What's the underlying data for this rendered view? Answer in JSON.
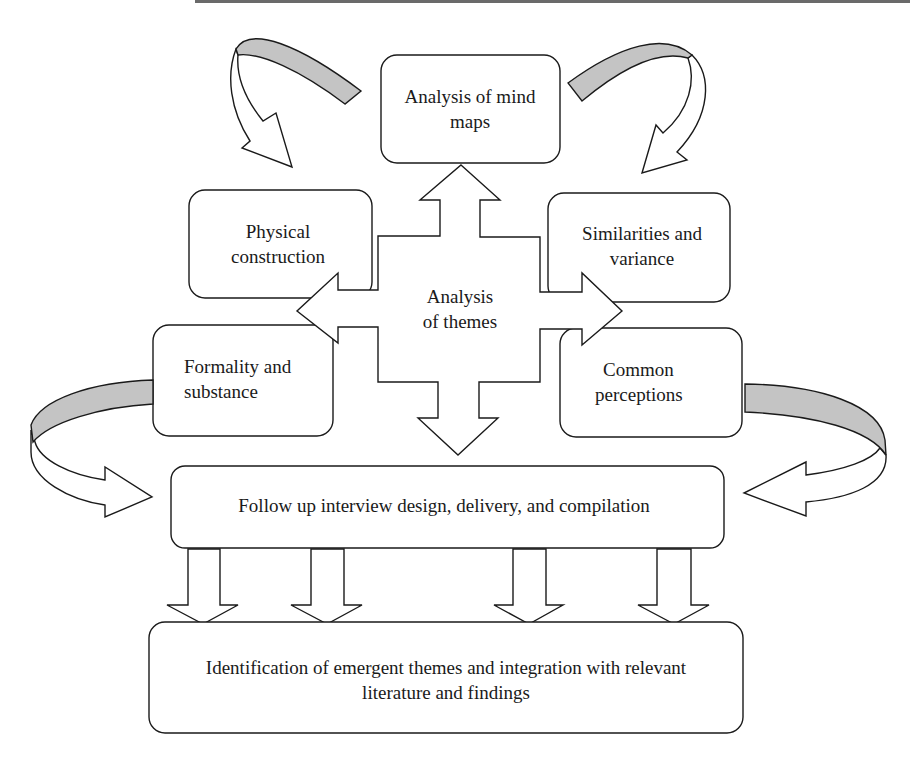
{
  "diagram": {
    "center": {
      "line1": "Analysis",
      "line2": "of themes"
    },
    "nodes": {
      "mind_maps": {
        "line1": "Analysis of mind",
        "line2": "maps"
      },
      "physical": {
        "line1": "Physical",
        "line2": "construction"
      },
      "similarities": {
        "line1": "Similarities and",
        "line2": "variance"
      },
      "formality": {
        "line1": "Formality and",
        "line2": "substance"
      },
      "perceptions": {
        "line1": "Common",
        "line2": "perceptions"
      },
      "follow_up": {
        "line1": "Follow up interview design, delivery, and compilation"
      },
      "emergent": {
        "line1": "Identification of emergent themes and integration with relevant",
        "line2": "literature and findings"
      }
    },
    "colors": {
      "stroke": "#1a1a1a",
      "band_fill": "#c4c4c4",
      "background": "#ffffff"
    }
  }
}
